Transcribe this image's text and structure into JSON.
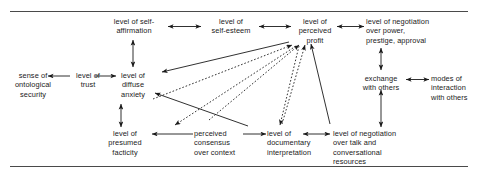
{
  "figure": {
    "title_rule_top": "",
    "title_rule_bottom": "",
    "background_color": "#ffffff",
    "text_color": "#1a1a1a",
    "line_color": "#1a1a1a",
    "rule_color": "#4a4a4a"
  },
  "nodes": {
    "self_affirmation": "level of self-\naffirmation",
    "self_esteem": "level of\nself-esteem",
    "perceived_profit": "level of\nperceived\nprofit",
    "negotiation_power": "level of negotiation\nover power,\nprestige, approval",
    "ontological_security": "sense of\nontological\nsecurity",
    "trust": "level of\ntrust",
    "diffuse_anxiety": "level of\ndiffuse\nanxiety",
    "exchange_with_others": "exchange\nwith others",
    "modes_of_interaction": "modes of\ninteraction\nwith others",
    "presumed_facticity": "level of\npresumed\nfacticity",
    "perceived_consensus": "perceived\nconsensus\nover context",
    "documentary_interpretation": "level of\ndocumentary\ninterpretation",
    "negotiation_talk": "level of negotiation\nover talk and\nconversational\nresources"
  },
  "edges": [
    {
      "id": "self-affirmation-to-self-esteem",
      "style": "solid",
      "heads": "both",
      "from": "self_affirmation",
      "to": "self_esteem"
    },
    {
      "id": "self-esteem-to-perceived-profit",
      "style": "solid",
      "heads": "both",
      "from": "self_esteem",
      "to": "perceived_profit"
    },
    {
      "id": "perceived-profit-to-negotiation-power",
      "style": "solid",
      "heads": "both",
      "from": "perceived_profit",
      "to": "negotiation_power"
    },
    {
      "id": "self-affirmation-to-diffuse-anxiety",
      "style": "solid",
      "heads": "both",
      "from": "self_affirmation",
      "to": "diffuse_anxiety"
    },
    {
      "id": "trust-to-ontological-security",
      "style": "solid",
      "heads": "start",
      "from": "trust",
      "to": "ontological_security"
    },
    {
      "id": "trust-to-diffuse-anxiety",
      "style": "solid",
      "heads": "end",
      "from": "trust",
      "to": "diffuse_anxiety"
    },
    {
      "id": "diffuse-anxiety-to-presumed-facticity",
      "style": "solid",
      "heads": "both",
      "from": "diffuse_anxiety",
      "to": "presumed_facticity"
    },
    {
      "id": "negotiation-power-to-exchange",
      "style": "solid",
      "heads": "both",
      "from": "negotiation_power",
      "to": "exchange_with_others"
    },
    {
      "id": "exchange-to-modes",
      "style": "solid",
      "heads": "both",
      "from": "exchange_with_others",
      "to": "modes_of_interaction"
    },
    {
      "id": "exchange-to-negotiation-talk",
      "style": "solid",
      "heads": "both",
      "from": "exchange_with_others",
      "to": "negotiation_talk"
    },
    {
      "id": "perceived-consensus-to-presumed-facticity",
      "style": "solid",
      "heads": "end",
      "from": "perceived_consensus",
      "to": "presumed_facticity"
    },
    {
      "id": "perceived-consensus-to-documentary",
      "style": "solid",
      "heads": "end",
      "from": "perceived_consensus",
      "to": "documentary_interpretation"
    },
    {
      "id": "documentary-to-negotiation-talk",
      "style": "solid",
      "heads": "both",
      "from": "documentary_interpretation",
      "to": "negotiation_talk"
    },
    {
      "id": "profit-down-to-self-affirmation-area",
      "style": "solid",
      "heads": "end",
      "from": "perceived_profit",
      "to": "diffuse_anxiety"
    },
    {
      "id": "negotiation-talk-to-perceived-profit",
      "style": "solid",
      "heads": "end",
      "from": "negotiation_talk",
      "to": "perceived_profit"
    },
    {
      "id": "negotiation-talk-to-diffuse-anxiety",
      "style": "solid",
      "heads": "end",
      "from": "negotiation_talk",
      "to": "diffuse_anxiety"
    },
    {
      "id": "presumed-facticity-to-perceived-profit",
      "style": "dotted",
      "heads": "end",
      "from": "presumed_facticity",
      "to": "perceived_profit"
    },
    {
      "id": "perceived-consensus-to-perceived-profit",
      "style": "dotted",
      "heads": "end",
      "from": "perceived_consensus",
      "to": "perceived_profit"
    },
    {
      "id": "documentary-to-perceived-profit",
      "style": "dotted",
      "heads": "end",
      "from": "documentary_interpretation",
      "to": "perceived_profit"
    },
    {
      "id": "profit-dotted-to-presumed-facticity",
      "style": "dotted",
      "heads": "end",
      "from": "perceived_profit",
      "to": "presumed_facticity"
    },
    {
      "id": "profit-dotted-to-documentary",
      "style": "dotted",
      "heads": "end",
      "from": "perceived_profit",
      "to": "documentary_interpretation"
    }
  ]
}
